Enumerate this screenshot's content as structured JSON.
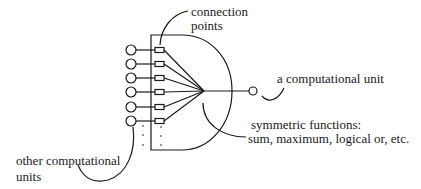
{
  "diagram": {
    "type": "neuron-unit-schematic",
    "stroke_color": "#1a1a1a",
    "labels": {
      "connection_points": [
        "connection",
        "points"
      ],
      "computational_unit": "a computational unit",
      "symmetric_functions": [
        "symmetric functions:",
        "sum, maximum, logical or, etc."
      ],
      "other_units": [
        "other computational",
        "units"
      ]
    },
    "inputs": {
      "count_shown": 6,
      "y": [
        50,
        64,
        78,
        92,
        107,
        121
      ],
      "continuation": "dots"
    },
    "convergence_point": {
      "x": 204,
      "y": 91
    },
    "output_unit": {
      "x": 253,
      "y": 91,
      "r": 4
    }
  }
}
